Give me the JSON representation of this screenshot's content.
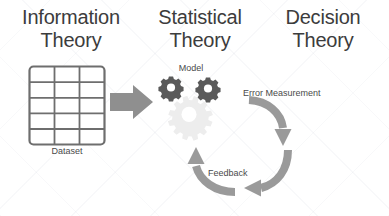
{
  "diagram": {
    "title_columns": [
      {
        "id": "information",
        "label": "Information\nTheory"
      },
      {
        "id": "statistical",
        "label": "Statistical\nTheory"
      },
      {
        "id": "decision",
        "label": "Decision\nTheory"
      }
    ],
    "labels": {
      "dataset": "Dataset",
      "model": "Model",
      "error_measurement": "Error Measurement",
      "feedback": "Feedback"
    },
    "shapes": {
      "dataset_table": {
        "columns": 3,
        "rows": 5
      },
      "gears": {
        "dark_count": 2,
        "faded_count": 1
      },
      "flow_arrow": {
        "direction": "right"
      },
      "cycle_arrows": [
        {
          "id": "error-measurement-arrow",
          "direction": "down"
        },
        {
          "id": "feedback-arrow",
          "direction": "left"
        },
        {
          "id": "return-arrow",
          "direction": "up"
        }
      ]
    },
    "colors": {
      "heading_text": "#3c3c3c",
      "caption_text": "#4a4a4a",
      "line_gray": "#6e6e6e",
      "arrow_gray": "#9a9a9a",
      "gear_dark": "#5a5a5a",
      "gear_faded": "#ededed",
      "background": "#ffffff"
    }
  }
}
